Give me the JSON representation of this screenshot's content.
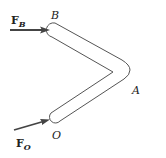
{
  "diagram": {
    "type": "bent-bar-free-body",
    "points": {
      "B": {
        "label": "B",
        "x": 57,
        "y": 30
      },
      "A": {
        "label": "A",
        "x": 128,
        "y": 70
      },
      "O": {
        "label": "O",
        "x": 57,
        "y": 116
      }
    },
    "forces": [
      {
        "name": "F_B",
        "main": "F",
        "subscript": "B",
        "direction": "horizontal-right",
        "applied_at": "B"
      },
      {
        "name": "F_O",
        "main": "F",
        "subscript": "O",
        "direction": "up-right",
        "applied_at": "O"
      }
    ],
    "colors": {
      "stroke": "#555555",
      "arrow": "#444444",
      "text": "#222222"
    }
  }
}
